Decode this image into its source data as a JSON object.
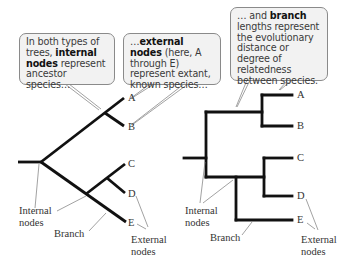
{
  "callouts": {
    "internal": {
      "pre": "In both types of trees, ",
      "bold": "internal nodes",
      "post": " represent ancestor species…"
    },
    "external": {
      "pre": "…",
      "bold": "external nodes",
      "post": " (here, A through E) represent extant, known species…"
    },
    "branch": {
      "pre": "… and ",
      "bold": "branch",
      "post": " lengths represent the evolutionary distance or degree of relatedness between species."
    }
  },
  "left_tree": {
    "tips": [
      "A",
      "B",
      "C",
      "D",
      "E"
    ],
    "labels": {
      "internal_nodes": "Internal nodes",
      "branch": "Branch",
      "external_nodes": "External nodes"
    }
  },
  "right_tree": {
    "tips": [
      "A",
      "B",
      "C",
      "D",
      "E"
    ],
    "labels": {
      "internal_nodes": "Internal nodes",
      "branch": "Branch",
      "external_nodes": "External nodes"
    }
  },
  "colors": {
    "branch": "#111111",
    "callout_fill": "#f2f2f2",
    "callout_border": "#8a8a8a",
    "leader": "#8a8a8a"
  }
}
